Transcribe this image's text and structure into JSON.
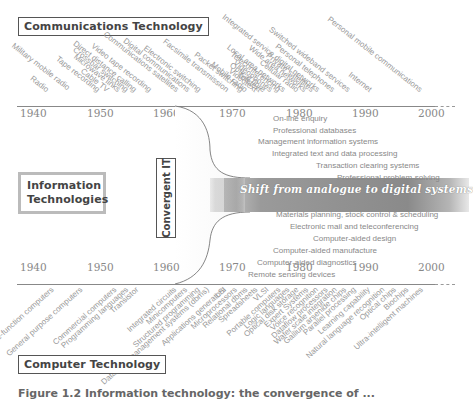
{
  "labels": {
    "communications": "Communications Technology",
    "information": "Information Technologies",
    "computer": "Computer Technology",
    "convergent": "Convergent IT",
    "shift": "Shift from analogue to digital systems",
    "caption": "Figure 1.2  Information technology: the convergence of ..."
  },
  "timeline_years": [
    "1940",
    "1950",
    "1960",
    "1970",
    "1980",
    "1990",
    "2000"
  ],
  "communications_items": [
    {
      "text": "Military mobile radio",
      "x": 66,
      "y": 93
    },
    {
      "text": "Radio",
      "x": 45,
      "y": 95
    },
    {
      "text": "Tape recording",
      "x": 96,
      "y": 95
    },
    {
      "text": "Cable TV",
      "x": 105,
      "y": 95
    },
    {
      "text": "Microwave links",
      "x": 116,
      "y": 95
    },
    {
      "text": "Crossbar switching",
      "x": 125,
      "y": 95
    },
    {
      "text": "Direct distance calling",
      "x": 133,
      "y": 95
    },
    {
      "text": "Video tape recording",
      "x": 148,
      "y": 95
    },
    {
      "text": "Communications satellites",
      "x": 175,
      "y": 95
    },
    {
      "text": "Digital communications",
      "x": 186,
      "y": 95
    },
    {
      "text": "Electronic switching",
      "x": 197,
      "y": 95
    },
    {
      "text": "Facsimile transmission",
      "x": 225,
      "y": 95
    },
    {
      "text": "Packet switching",
      "x": 240,
      "y": 95
    },
    {
      "text": "Mobile radio",
      "x": 244,
      "y": 95
    },
    {
      "text": "Videotext",
      "x": 253,
      "y": 95
    },
    {
      "text": "Teletext",
      "x": 258,
      "y": 95
    },
    {
      "text": "Optical fibre",
      "x": 262,
      "y": 95
    },
    {
      "text": "Videophones",
      "x": 269,
      "y": 95
    },
    {
      "text": "Teleconferencing",
      "x": 276,
      "y": 95
    },
    {
      "text": "Local area networks",
      "x": 282,
      "y": 95
    },
    {
      "text": "Cellular radio",
      "x": 295,
      "y": 95
    },
    {
      "text": "Wide area networks",
      "x": 303,
      "y": 95
    },
    {
      "text": "Private satellites",
      "x": 310,
      "y": 95
    },
    {
      "text": "Integrated service digital networks",
      "x": 316,
      "y": 95
    },
    {
      "text": "Personal telephones",
      "x": 331,
      "y": 95
    },
    {
      "text": "Switched wideband services",
      "x": 347,
      "y": 95
    },
    {
      "text": "Internet",
      "x": 368,
      "y": 95
    },
    {
      "text": "Personal mobile communications",
      "x": 418,
      "y": 95
    }
  ],
  "it_applications_upper": [
    {
      "text": "On-line enquiry",
      "x": 273,
      "y": 120
    },
    {
      "text": "Professional databases",
      "x": 273,
      "y": 132
    },
    {
      "text": "Management information systems",
      "x": 258,
      "y": 143
    },
    {
      "text": "Integrated text and data processing",
      "x": 272,
      "y": 155
    },
    {
      "text": "Transaction clearing systems",
      "x": 316,
      "y": 167
    },
    {
      "text": "Professional problem-solving",
      "x": 337,
      "y": 179
    }
  ],
  "it_applications_lower": [
    {
      "text": "Materials planning, stock control & scheduling",
      "x": 276,
      "y": 216
    },
    {
      "text": "Electronic mail and teleconferencing",
      "x": 290,
      "y": 228
    },
    {
      "text": "Computer-aided design",
      "x": 313,
      "y": 240
    },
    {
      "text": "Computer-aided manufacture",
      "x": 273,
      "y": 252
    },
    {
      "text": "Computer-aided diagnostics",
      "x": 257,
      "y": 264
    },
    {
      "text": "Remote sensing devices",
      "x": 248,
      "y": 276
    }
  ],
  "computer_items": [
    {
      "text": "Single-function computers",
      "x": 50,
      "y": 284
    },
    {
      "text": "General purpose computers",
      "x": 78,
      "y": 284
    },
    {
      "text": "Commercial computers",
      "x": 112,
      "y": 284
    },
    {
      "text": "Programming languages",
      "x": 124,
      "y": 284
    },
    {
      "text": "Transistor",
      "x": 134,
      "y": 284
    },
    {
      "text": "Integrated circuits",
      "x": 172,
      "y": 284
    },
    {
      "text": "Minicomputers",
      "x": 183,
      "y": 284
    },
    {
      "text": "Structured programming",
      "x": 195,
      "y": 284
    },
    {
      "text": "Database management systems (dbms)",
      "x": 205,
      "y": 284
    },
    {
      "text": "LSI",
      "x": 222,
      "y": 284
    },
    {
      "text": "Applications generators",
      "x": 222,
      "y": 284
    },
    {
      "text": "Microprocessors",
      "x": 233,
      "y": 284
    },
    {
      "text": "Relational dbms",
      "x": 243,
      "y": 284
    },
    {
      "text": "Spreadsheets",
      "x": 253,
      "y": 284
    },
    {
      "text": "VLSI",
      "x": 264,
      "y": 284
    },
    {
      "text": "Portable computers",
      "x": 276,
      "y": 284
    },
    {
      "text": "Logic languages",
      "x": 285,
      "y": 284
    },
    {
      "text": "Optical disk storage",
      "x": 294,
      "y": 284
    },
    {
      "text": "Expert Systems",
      "x": 304,
      "y": 284
    },
    {
      "text": "Voice recognition",
      "x": 314,
      "y": 284
    },
    {
      "text": "Dataflow processors",
      "x": 323,
      "y": 284
    },
    {
      "text": "Wafer scale integration",
      "x": 333,
      "y": 284
    },
    {
      "text": "Gallium arsenide chips",
      "x": 342,
      "y": 284
    },
    {
      "text": "Parallel processing",
      "x": 352,
      "y": 284
    },
    {
      "text": "Learning capability",
      "x": 366,
      "y": 284
    },
    {
      "text": "Natural language recognition",
      "x": 380,
      "y": 284
    },
    {
      "text": "Optical chips",
      "x": 392,
      "y": 284
    },
    {
      "text": "Biochips",
      "x": 404,
      "y": 284
    },
    {
      "text": "Ultra-intelligent machines",
      "x": 419,
      "y": 284
    }
  ]
}
